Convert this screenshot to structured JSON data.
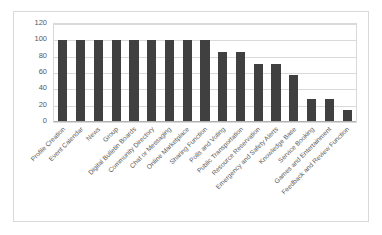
{
  "chart_data": {
    "type": "bar",
    "title": "",
    "subtitle": "",
    "xlabel": "",
    "ylabel": "",
    "ylim": [
      0,
      120
    ],
    "yticks": [
      0,
      20,
      40,
      60,
      80,
      100,
      120
    ],
    "grid": true,
    "legend": false,
    "legend_position": "none",
    "bar_color": "#404040",
    "gridline_color": "#d9d9d9",
    "plot_background": "#ffffff",
    "frame_border_color": "#d9d9d9",
    "axis_label_color": "#595959",
    "categories": [
      "Profile Creation",
      "Event Calendar",
      "News",
      "Group",
      "Digital Bulletin Boards",
      "Community Directory",
      "Chat or Messaging",
      "Online Marketplace",
      "Sharing Function",
      "Polls and Voting",
      "Public Transportation",
      "Resource Reservation",
      "Emergency and Safety Alerts",
      "Knowledge Base",
      "Service Booking",
      "Games and Entertainment",
      "Feedback and Review Function"
    ],
    "values": [
      100,
      100,
      100,
      100,
      100,
      100,
      100,
      100,
      100,
      85.7,
      85.7,
      71.4,
      71.4,
      57.1,
      28.6,
      28.6,
      14.3
    ]
  }
}
